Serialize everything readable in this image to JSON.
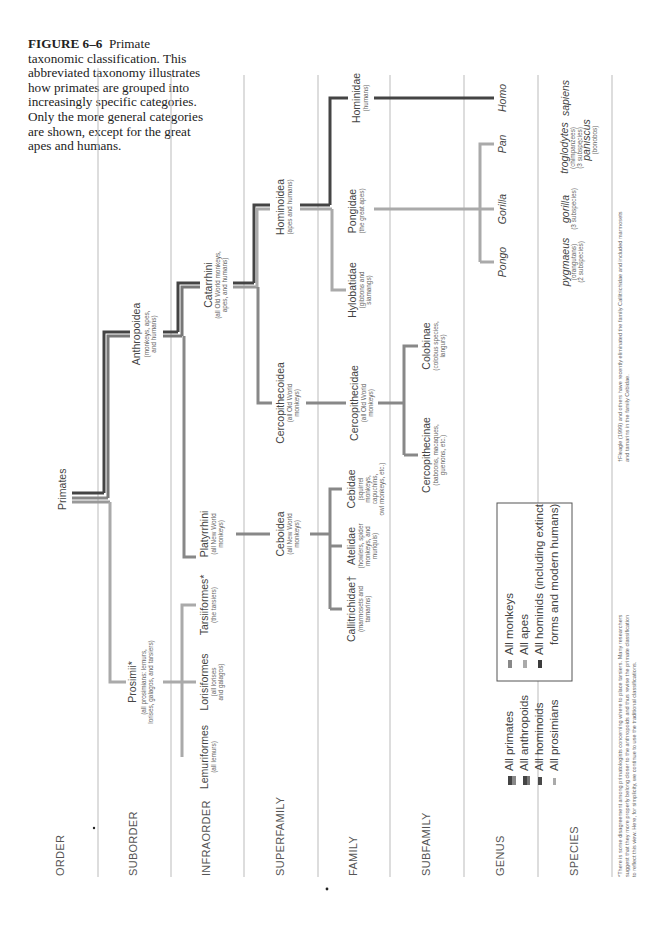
{
  "caption": {
    "label": "FIGURE 6–6",
    "text": "Primate taxonomic classification. This abbreviated taxonomy illustrates how primates are grouped into increasingly specific categories. Only the more general categories are shown, except for the great apes and humans."
  },
  "ranks": [
    "ORDER",
    "SUBORDER",
    "INFRAORDER",
    "SUPERFAMILY",
    "FAMILY",
    "SUBFAMILY",
    "GENUS",
    "SPECIES"
  ],
  "order": {
    "name": "Primates"
  },
  "suborder": [
    {
      "name": "Prosimii*",
      "desc1": "(all prosimians: lemurs,",
      "desc2": "lorises, galagos, and tarsiers)"
    },
    {
      "name": "Anthropoidea",
      "desc1": "(monkeys, apes,",
      "desc2": "and humans)"
    }
  ],
  "infraorder": [
    {
      "name": "Lemuriformes",
      "desc1": "(all lemurs)"
    },
    {
      "name": "Lorisiformes",
      "desc1": "(all lorises",
      "desc2": "and galagos)"
    },
    {
      "name": "Tarsiiformes*",
      "desc1": "(the tarsiers)"
    },
    {
      "name": "Platyrrhini",
      "desc1": "(all New World",
      "desc2": "monkeys)"
    },
    {
      "name": "Catarrhini",
      "desc1": "(all Old World monkeys,",
      "desc2": "apes, and humans)"
    }
  ],
  "superfamily": [
    {
      "name": "Ceboidea",
      "desc1": "(all New World",
      "desc2": "monkeys)"
    },
    {
      "name": "Cercopithecoidea",
      "desc1": "(all Old World",
      "desc2": "monkeys)"
    },
    {
      "name": "Hominoidea",
      "desc1": "(apes and humans)"
    }
  ],
  "family": [
    {
      "name": "Callitrichidae†",
      "desc1": "(marmosets and",
      "desc2": "tamarins)"
    },
    {
      "name": "Atelidae",
      "desc1": "(howlers, spider",
      "desc2": "monkeys, and",
      "desc3": "muriquis)"
    },
    {
      "name": "Cebidae",
      "desc1": "(squirrel",
      "desc2": "monkeys,",
      "desc3": "capuchins,",
      "desc4": "owl monkeys, etc.)"
    },
    {
      "name": "Cercopithecidae",
      "desc1": "(all Old World",
      "desc2": "monkeys)"
    },
    {
      "name": "Hylobatidae",
      "desc1": "(gibbons and",
      "desc2": "siamangs)"
    },
    {
      "name": "Pongidae",
      "desc1": "(the great apes)"
    },
    {
      "name": "Hominidae",
      "desc1": "(humans)"
    }
  ],
  "subfamily": [
    {
      "name": "Cercopithecinae",
      "desc1": "(baboons, macaques,",
      "desc2": "guenons, etc.)"
    },
    {
      "name": "Colobinae",
      "desc1": "(colobus species,",
      "desc2": "langurs)"
    }
  ],
  "genus": [
    "Pongo",
    "Gorilla",
    "Pan",
    "Homo"
  ],
  "species": [
    {
      "name": "pygmaeus",
      "desc1": "(orangutans)",
      "desc2": "(2 subspecies)"
    },
    {
      "name": "gorilla",
      "desc1": "(3 subspecies)"
    },
    {
      "name": "troglodytes",
      "desc1": "(chimpanzees)",
      "desc2": "(3 subspecies)"
    },
    {
      "name": "paniscus",
      "desc1": "(bonobos)"
    },
    {
      "name": "sapiens"
    }
  ],
  "legend": {
    "items": [
      "All primates",
      "All anthropoids",
      "All hominoids",
      "All prosimians",
      "All monkeys",
      "All apes",
      "All hominids (including extinct",
      "forms and modern humans)"
    ]
  },
  "footnotes": {
    "star1": "*There is some disagreement among primatologists concerning where to place tarsiers. Many researchers",
    "star2": "suggest that they more properly belong closer to the anthropoids and thus revise the primate classification",
    "star3": "to reflect this view. Here, for simplicity, we continue to use the traditional classifications.",
    "dagger1": "†Fleagle (1999) and others have recently eliminated the family Callitrichidae and included marmosets",
    "dagger2": "and tamarins in the family Cebidae."
  },
  "colors": {
    "primates": "#555555",
    "anthropoids": "#777777",
    "hominoids": "#4a4a4a",
    "prosimians": "#aaaaaa",
    "monkeys": "#888888",
    "apes": "#b0b0b0",
    "hominids": "#3c3c3c",
    "separator": "#bbbbbb"
  }
}
